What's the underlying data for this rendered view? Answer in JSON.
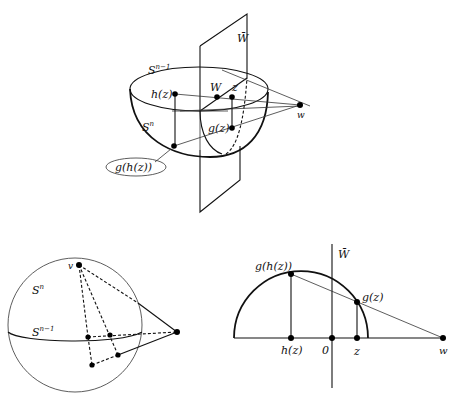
{
  "figure_top": {
    "labels": {
      "plane": "W̄",
      "boundary_sphere": "S",
      "boundary_sphere_exp": "n−1",
      "hemisphere": "S",
      "hemisphere_exp": "n",
      "h_z": "h(z)",
      "W": "W",
      "z": "z",
      "g_z": "g(z)",
      "g_h_z": "g(h(z))",
      "w": "w"
    }
  },
  "figure_bottom_left": {
    "labels": {
      "v": "v",
      "sphere": "S",
      "sphere_exp": "n",
      "equator": "S",
      "equator_exp": "n−1"
    }
  },
  "figure_bottom_right": {
    "labels": {
      "plane": "W̄",
      "g_h_z": "g(h(z))",
      "g_z": "g(z)",
      "h_z": "h(z)",
      "origin": "0",
      "z": "z",
      "w": "w"
    }
  }
}
